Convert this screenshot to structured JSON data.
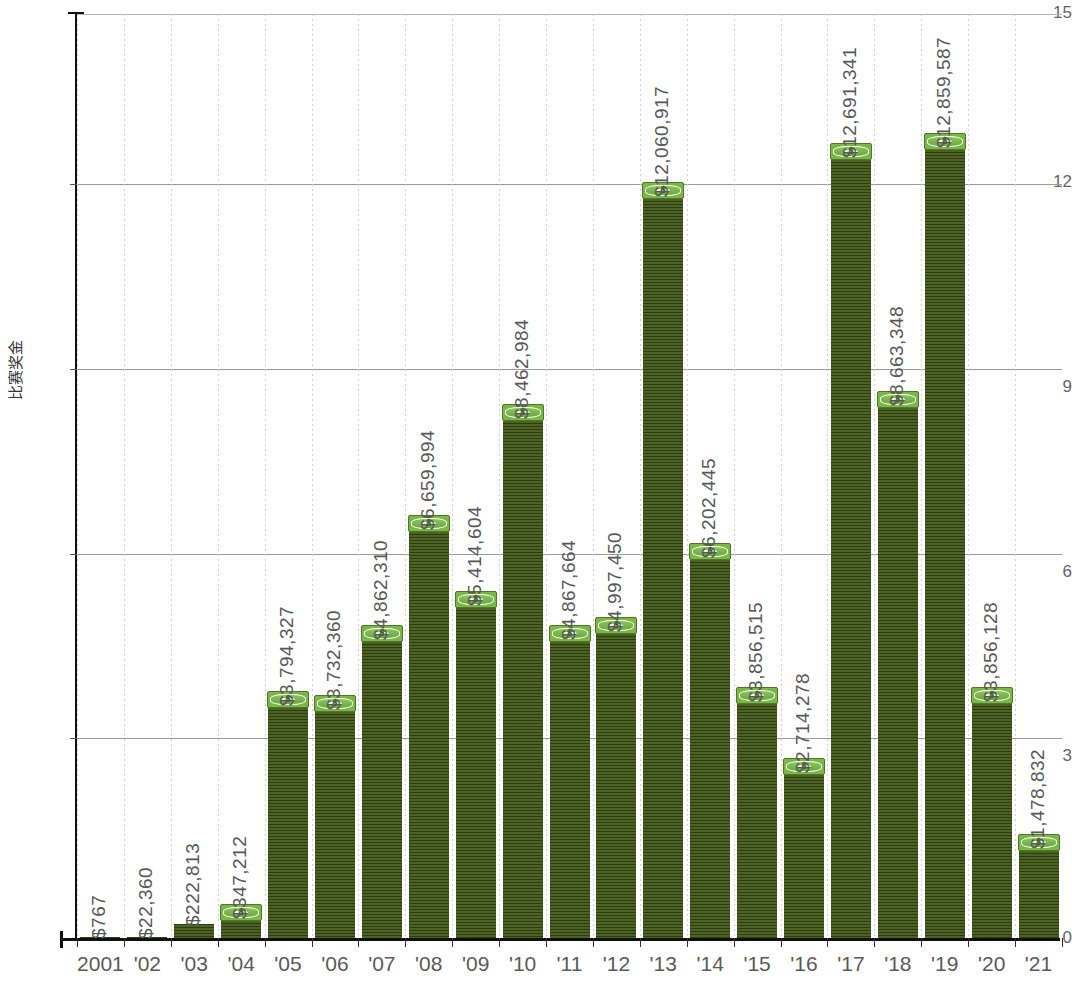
{
  "chart_data": {
    "type": "bar",
    "title": "",
    "xlabel": "",
    "ylabel": "比赛奖金",
    "ylim": [
      0,
      15
    ],
    "y_unit": "millions",
    "grid": true,
    "legend": "none",
    "y_ticks": [
      "0",
      "3",
      "6",
      "9",
      "12",
      "15"
    ],
    "categories": [
      "2001",
      "'02",
      "'03",
      "'04",
      "'05",
      "'06",
      "'07",
      "'08",
      "'09",
      "'10",
      "'11",
      "'12",
      "'13",
      "'14",
      "'15",
      "'16",
      "'17",
      "'18",
      "'19",
      "'20",
      "'21"
    ],
    "value_labels": [
      "$767",
      "$22,360",
      "$222,813",
      "$347,212",
      "$3,794,327",
      "$3,732,360",
      "$4,862,310",
      "$6,659,994",
      "$5,414,604",
      "$8,462,984",
      "$4,867,664",
      "$4,997,450",
      "$12,060,917",
      "$6,202,445",
      "$3,856,515",
      "$2,714,278",
      "$12,691,341",
      "$8,663,348",
      "$12,859,587",
      "$3,856,128",
      "$1,478,832"
    ],
    "values": [
      0.000767,
      0.02236,
      0.222813,
      0.347212,
      3.794327,
      3.73236,
      4.86231,
      6.659994,
      5.414604,
      8.462984,
      4.867664,
      4.99745,
      12.060917,
      6.202445,
      3.856515,
      2.714278,
      12.691341,
      8.663348,
      12.859587,
      3.856128,
      1.478832
    ]
  },
  "colors": {
    "bar_body": "#3f5714",
    "bar_cap": "#7ab648",
    "axis": "#111111",
    "grid": "#9a9a9a",
    "text": "#585858"
  }
}
